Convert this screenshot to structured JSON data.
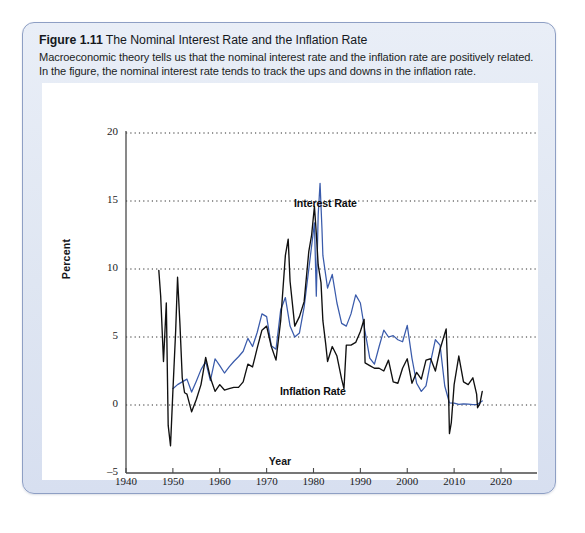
{
  "figure": {
    "number": "Figure 1.11",
    "title": "The Nominal Interest Rate and the Inflation Rate",
    "subtitle": "Macroeconomic theory tells us that the nominal interest rate and the inflation rate are positively related. In the figure, the nominal interest rate tends to track the ups and downs in the inflation rate."
  },
  "chart_data": {
    "type": "line",
    "title": "The Nominal Interest Rate and the Inflation Rate",
    "xlabel": "Year",
    "ylabel": "Percent",
    "xlim": [
      1940,
      2020
    ],
    "ylim": [
      -5,
      20
    ],
    "xticks": [
      1940,
      1950,
      1960,
      1970,
      1980,
      1990,
      2000,
      2010,
      2020
    ],
    "yticks": [
      -5,
      0,
      5,
      10,
      15,
      20
    ],
    "grid": "horizontal-dotted",
    "legend": "inline-annotations",
    "colors": {
      "interest_rate": "#3a5bab",
      "inflation_rate": "#101010"
    },
    "annotations": [
      {
        "text": "Interest Rate",
        "x": 1983,
        "y": 14.6
      },
      {
        "text": "Inflation Rate",
        "x": 1982,
        "y": 0.9
      }
    ],
    "series": [
      {
        "name": "Interest Rate",
        "color": "#3a5bab",
        "x": [
          1950,
          1951,
          1952,
          1953,
          1954,
          1955,
          1956,
          1957,
          1958,
          1959,
          1960,
          1961,
          1962,
          1963,
          1964,
          1965,
          1966,
          1967,
          1968,
          1969,
          1970,
          1971,
          1972,
          1973,
          1974,
          1975,
          1976,
          1977,
          1978,
          1979,
          1980.2,
          1980.6,
          1981.0,
          1981.4,
          1981.8,
          1982,
          1983,
          1984,
          1985,
          1986,
          1987,
          1988,
          1989,
          1990,
          1991,
          1992,
          1993,
          1994,
          1995,
          1996,
          1997,
          1998,
          1999,
          2000,
          2001,
          2002,
          2003,
          2004,
          2005,
          2006,
          2007,
          2008,
          2009,
          2010,
          2011,
          2012,
          2013,
          2014,
          2015,
          2016
        ],
        "values": [
          1.2,
          1.5,
          1.7,
          1.9,
          0.95,
          1.75,
          2.6,
          3.2,
          1.8,
          3.4,
          2.9,
          2.35,
          2.8,
          3.2,
          3.55,
          3.95,
          4.9,
          4.3,
          5.35,
          6.7,
          6.5,
          4.35,
          4.1,
          7.0,
          7.9,
          5.8,
          5.0,
          5.3,
          7.2,
          10.0,
          13.4,
          8.0,
          14.0,
          16.3,
          13.0,
          11.0,
          8.6,
          9.6,
          7.5,
          6.0,
          5.8,
          6.7,
          8.1,
          7.5,
          5.4,
          3.45,
          3.0,
          4.3,
          5.5,
          5.0,
          5.1,
          4.8,
          4.65,
          5.85,
          3.45,
          1.6,
          1.0,
          1.4,
          3.2,
          4.8,
          4.4,
          1.4,
          0.15,
          0.14,
          0.05,
          0.09,
          0.06,
          0.03,
          0.05,
          0.3
        ]
      },
      {
        "name": "Inflation Rate",
        "color": "#101010",
        "x": [
          1947.0,
          1947.4,
          1948.0,
          1948.6,
          1949.0,
          1949.5,
          1950.0,
          1950.6,
          1951.0,
          1951.5,
          1952.0,
          1952.5,
          1953.0,
          1954.0,
          1955.0,
          1956.0,
          1957.0,
          1958.0,
          1959.0,
          1960.0,
          1961.0,
          1962.0,
          1963.0,
          1964.0,
          1965.0,
          1966.0,
          1967.0,
          1968.0,
          1969.0,
          1970.0,
          1971.0,
          1972.0,
          1973.0,
          1974.0,
          1974.6,
          1975.0,
          1976.0,
          1977.0,
          1978.0,
          1979.0,
          1979.6,
          1980.2,
          1980.6,
          1981.0,
          1981.6,
          1982.0,
          1982.6,
          1983.0,
          1984.0,
          1985.0,
          1986.0,
          1986.5,
          1987.0,
          1988.0,
          1989.0,
          1990.0,
          1990.8,
          1991.0,
          1992.0,
          1993.0,
          1994.0,
          1995.0,
          1996.0,
          1997.0,
          1998.0,
          1999.0,
          2000.0,
          2001.0,
          2002.0,
          2003.0,
          2004.0,
          2005.0,
          2006.0,
          2007.0,
          2008.3,
          2008.8,
          2009.0,
          2009.4,
          2010.0,
          2011.0,
          2012.0,
          2013.0,
          2014.0,
          2014.8,
          2015.0,
          2015.5,
          2016.0
        ],
        "values": [
          9.9,
          8.0,
          3.2,
          7.5,
          -1.5,
          -3.0,
          1.0,
          5.5,
          9.4,
          6.0,
          2.0,
          0.9,
          0.8,
          -0.5,
          0.4,
          1.5,
          3.5,
          2.0,
          1.0,
          1.5,
          1.1,
          1.2,
          1.3,
          1.3,
          1.7,
          3.0,
          2.8,
          4.2,
          5.5,
          5.8,
          4.3,
          3.3,
          6.2,
          11.0,
          12.2,
          9.1,
          5.8,
          6.5,
          7.6,
          11.3,
          12.5,
          14.6,
          12.6,
          10.3,
          9.0,
          6.2,
          4.5,
          3.2,
          4.3,
          3.6,
          1.9,
          1.2,
          4.4,
          4.4,
          4.6,
          5.4,
          6.3,
          3.1,
          2.9,
          2.7,
          2.7,
          2.5,
          3.3,
          1.7,
          1.6,
          2.7,
          3.4,
          1.6,
          2.4,
          1.9,
          3.3,
          3.4,
          2.5,
          4.1,
          5.6,
          1.1,
          -2.1,
          -1.3,
          1.5,
          3.6,
          1.7,
          1.5,
          2.0,
          0.8,
          -0.2,
          0.1,
          1.0
        ]
      }
    ]
  }
}
